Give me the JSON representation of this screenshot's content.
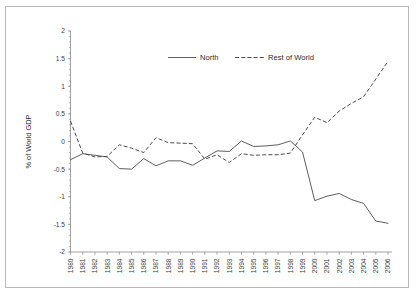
{
  "chart_data": {
    "type": "line",
    "title": "",
    "xlabel": "",
    "ylabel": "% of World GDP",
    "ylim": [
      -2,
      2
    ],
    "ytick_step": 0.5,
    "yticks": [
      "2",
      "1.5",
      "1",
      "0.5",
      "0",
      "-0.5",
      "-1",
      "-1.5",
      "-2"
    ],
    "grid": false,
    "legend_position": "top-center",
    "x": [
      1980,
      1981,
      1982,
      1983,
      1984,
      1985,
      1986,
      1987,
      1988,
      1989,
      1990,
      1991,
      1992,
      1993,
      1994,
      1995,
      1996,
      1997,
      1998,
      1999,
      2000,
      2001,
      2002,
      2003,
      2004,
      2005,
      2006
    ],
    "categories": [
      "1980",
      "1981",
      "1982",
      "1983",
      "1984",
      "1985",
      "1986",
      "1987",
      "1988",
      "1989",
      "1990",
      "1991",
      "1992",
      "1993",
      "1994",
      "1995",
      "1996",
      "1997",
      "1998",
      "1999",
      "2000",
      "2001",
      "2002",
      "2003",
      "2004",
      "2005",
      "2006"
    ],
    "series": [
      {
        "name": "North",
        "style": "solid",
        "color": "#4c4c4c",
        "values": [
          -0.33,
          -0.22,
          -0.25,
          -0.28,
          -0.49,
          -0.5,
          -0.31,
          -0.44,
          -0.35,
          -0.35,
          -0.43,
          -0.3,
          -0.17,
          -0.18,
          0.01,
          -0.09,
          -0.08,
          -0.06,
          0.01,
          -0.19,
          -1.07,
          -0.99,
          -0.94,
          -1.05,
          -1.12,
          -1.44,
          -1.48
        ]
      },
      {
        "name": "Rest of World",
        "style": "dashed",
        "color": "#4c4c4c",
        "values": [
          0.37,
          -0.21,
          -0.28,
          -0.27,
          -0.06,
          -0.12,
          -0.2,
          0.07,
          -0.02,
          -0.03,
          -0.04,
          -0.32,
          -0.24,
          -0.38,
          -0.22,
          -0.25,
          -0.24,
          -0.24,
          -0.21,
          0.12,
          0.44,
          0.34,
          0.55,
          0.69,
          0.81,
          1.13,
          1.45
        ]
      }
    ]
  },
  "legend": {
    "items": [
      {
        "label": "North",
        "style": "solid"
      },
      {
        "label": "Rest of World",
        "style": "dashed"
      }
    ]
  }
}
